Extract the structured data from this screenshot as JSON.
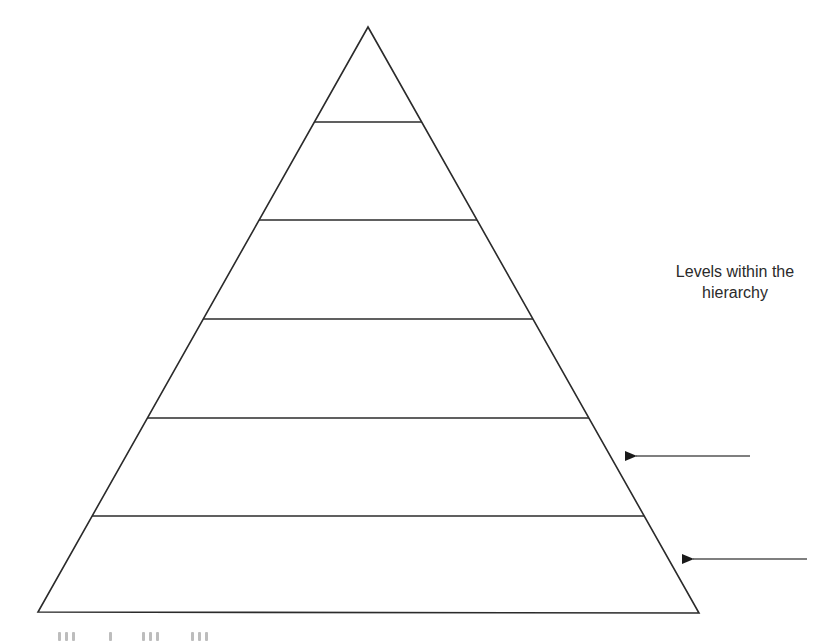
{
  "diagram": {
    "type": "pyramid",
    "title": "Levels within the hierarchy",
    "label_lines": [
      "Levels within the",
      "hierarchy"
    ],
    "level_count": 6,
    "levels": [
      {
        "index": 1,
        "label": ""
      },
      {
        "index": 2,
        "label": ""
      },
      {
        "index": 3,
        "label": ""
      },
      {
        "index": 4,
        "label": ""
      },
      {
        "index": 5,
        "label": ""
      },
      {
        "index": 6,
        "label": ""
      }
    ],
    "arrows": [
      {
        "name": "arrow-level-5",
        "points_to_level": 5
      },
      {
        "name": "arrow-level-6",
        "points_to_level": 6
      }
    ],
    "colors": {
      "stroke": "#2b2b2b",
      "arrow": "#555555",
      "text": "#2a2a2a",
      "background": "#ffffff"
    }
  }
}
